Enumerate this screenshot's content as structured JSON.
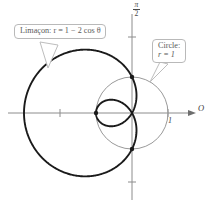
{
  "figure": {
    "background": "#ffffff",
    "origin_px": [
      132,
      113
    ],
    "unit_px": 36
  },
  "axes": {
    "x_axis": {
      "label": "O",
      "arrow": true,
      "color": "#8c8c8c",
      "tick_labels": [
        "1"
      ],
      "tick_positions_units": [
        -2,
        1
      ]
    },
    "y_axis": {
      "label_numerator": "π",
      "label_denominator": "2",
      "color": "#8c8c8c",
      "tick_positions_units": [
        2.1,
        -1.9
      ]
    }
  },
  "callouts": [
    {
      "id": "limacon",
      "name": "Limaçon",
      "text": "Limaçon:  r = 1 − 2 cos θ",
      "label_prefix": "Limaçon: ",
      "equation": "r = 1 − 2 cos θ",
      "border_color": "#b9b9b9",
      "text_color": "#5a5a5a"
    },
    {
      "id": "circle",
      "name": "Circle",
      "text": "Circle: r = 1",
      "line1": "Circle:",
      "line2": "r = 1",
      "border_color": "#b9b9b9",
      "text_color": "#5a5a5a"
    }
  ],
  "chart_data": {
    "type": "line",
    "title": "",
    "subtitle": "",
    "coordinate_system": "polar",
    "xlabel": "O",
    "ylabel": "π/2",
    "xlim": [
      -3.0,
      2.05
    ],
    "ylim": [
      -2.6,
      2.6
    ],
    "grid": false,
    "legend": "callout-annotations",
    "annotations": [
      "Limaçon: r = 1 − 2 cos θ",
      "Circle: r = 1",
      "1"
    ],
    "series": [
      {
        "name": "Limaçon",
        "equation": "r = 1 - 2 cos(theta)",
        "color": "#1a1a1a",
        "line_width": 1.9,
        "theta_range_deg": [
          0,
          360
        ],
        "r_at_theta": {
          "0": -1,
          "60": 0,
          "90": 1,
          "120": 2,
          "180": 3,
          "240": 2,
          "270": 1,
          "300": 0
        },
        "features": {
          "inner_loop": true,
          "max_abs_r": 3,
          "leftmost_point_units": [
            -3,
            0
          ],
          "inner_loop_extent_units": [
            -1,
            0
          ]
        }
      },
      {
        "name": "Circle",
        "equation": "r = 1",
        "color": "#9a9a9a",
        "line_width": 1.0,
        "center_units": [
          0,
          0
        ],
        "radius_units": 1
      }
    ],
    "intersection_points_units": [
      [
        0,
        1
      ],
      [
        0,
        -1
      ],
      [
        -1,
        0
      ]
    ]
  }
}
